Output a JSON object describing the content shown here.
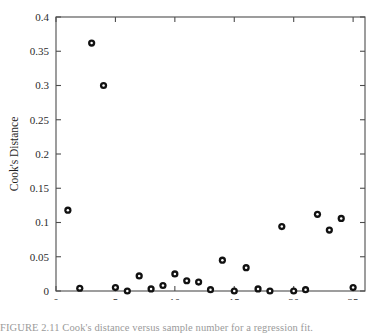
{
  "figure": {
    "caption": "FIGURE 2.11  Cook's distance versus sample number for a regression fit."
  },
  "chart_data": {
    "type": "scatter",
    "title": "",
    "xlabel": "Sample Number",
    "ylabel": "Cook's Distance",
    "xlim": [
      0,
      26
    ],
    "ylim": [
      0,
      0.4
    ],
    "grid": false,
    "legend": null,
    "xticks": [
      0,
      5,
      10,
      15,
      20,
      25
    ],
    "xticklabels": [
      "0",
      "5",
      "10",
      "15",
      "20",
      "25"
    ],
    "yticks": [
      0,
      0.05,
      0.1,
      0.15,
      0.2,
      0.25,
      0.3,
      0.35,
      0.4
    ],
    "yticklabels": [
      "0",
      "0.05",
      "0.1",
      "0.15",
      "0.2",
      "0.25",
      "0.3",
      "0.35",
      "0.4"
    ],
    "marker": "open-circle",
    "marker_color": "#111111",
    "x": [
      1,
      2,
      3,
      4,
      5,
      6,
      7,
      8,
      9,
      10,
      11,
      12,
      13,
      14,
      15,
      16,
      17,
      18,
      19,
      20,
      21,
      22,
      23,
      24,
      25
    ],
    "y": [
      0.118,
      0.004,
      0.362,
      0.3,
      0.005,
      0.0,
      0.022,
      0.003,
      0.008,
      0.025,
      0.015,
      0.013,
      0.002,
      0.045,
      0.0,
      0.034,
      0.003,
      0.0,
      0.094,
      0.0,
      0.002,
      0.112,
      0.089,
      0.106,
      0.005
    ],
    "series": [
      {
        "name": "Cook's Distance",
        "values": [
          0.118,
          0.004,
          0.362,
          0.3,
          0.005,
          0.0,
          0.022,
          0.003,
          0.008,
          0.025,
          0.015,
          0.013,
          0.002,
          0.045,
          0.0,
          0.034,
          0.003,
          0.0,
          0.094,
          0.0,
          0.002,
          0.112,
          0.089,
          0.106,
          0.005
        ]
      }
    ]
  }
}
